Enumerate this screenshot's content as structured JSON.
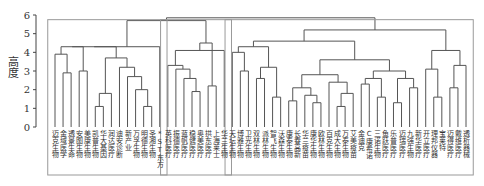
{
  "chart_data": {
    "type": "dendrogram",
    "title": "",
    "xlabel": "",
    "ylabel": "高度",
    "ylim": [
      0,
      6
    ],
    "yticks": [
      0,
      1,
      2,
      3,
      4,
      5,
      6
    ],
    "leaves": [
      "迈克生物",
      "金域医学",
      "透景生命",
      "安图生物",
      "美康生物",
      "凯普生物",
      "华大基因",
      "润达医疗",
      "迪安诊断",
      "新产业",
      "万孚生物",
      "明德生物",
      "圣湘生物",
      "*ST东方",
      "英科医疗",
      "振德医疗",
      "蓝帆医疗",
      "稳健医疗",
      "奥美医疗",
      "拱东医疗",
      "上海莱士",
      "华兰生物",
      "天坛生物",
      "博雅生物",
      "卫光生物",
      "双林生物",
      "派林生物",
      "智飞生物",
      "沃森生物",
      "康泰生物",
      "长春高新",
      "华兰疫苗",
      "康华生物",
      "欧林生物",
      "百克生物",
      "成大生物",
      "万泰生物",
      "艾美疫苗",
      "金迪克",
      "C康希诺",
      "三诺生物",
      "鱼跃医疗",
      "乐普医疗",
      "迈瑞医疗",
      "九强生物",
      "新华医疗",
      "开立医疗",
      "理邦仪器",
      "宝莱特",
      "迈得医疗",
      "戴维医疗",
      "透析器械"
    ],
    "clusters": [
      {
        "name": "cluster-1",
        "leaf_range": [
          0,
          13
        ]
      },
      {
        "name": "cluster-2",
        "leaf_range": [
          14,
          21
        ]
      },
      {
        "name": "cluster-3",
        "leaf_range": [
          22,
          51
        ]
      }
    ],
    "grid": false,
    "legend": null
  }
}
